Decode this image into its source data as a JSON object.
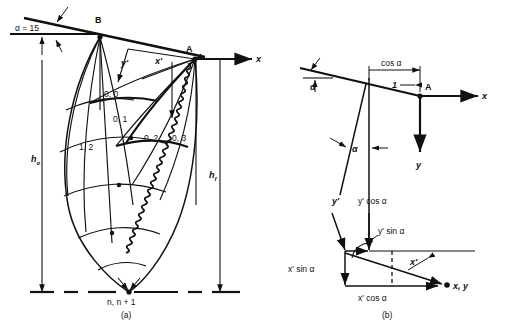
{
  "figure": {
    "caption_a": "(a)",
    "caption_b": "(b)"
  },
  "panel_a": {
    "alpha_label": "α = 15",
    "point_b": "B",
    "point_a": "A",
    "axis_x": "x",
    "axis_y_prime": "y'",
    "axis_x_prime": "x'",
    "height_initial": "h",
    "height_initial_sub": "o",
    "height_final": "h",
    "height_final_sub": "f",
    "node_bottom": "n, n + 1",
    "grid_nodes": [
      {
        "label": "0, 0"
      },
      {
        "label": "0, 1"
      },
      {
        "label": "0, 2"
      },
      {
        "label": "0, 3"
      },
      {
        "label": "1, 2"
      }
    ]
  },
  "panel_b": {
    "alpha_top": "α",
    "alpha_lower": "α",
    "cos_alpha": "cos α",
    "unit_length": "1",
    "point_a": "A",
    "axis_x": "x",
    "axis_y": "y",
    "y_prime": "y'",
    "y_prime_cos_alpha": "y' cos α",
    "y_prime_sin_alpha": "y' sin α",
    "x_prime_sin_alpha": "x' sin α",
    "x_prime": "x'",
    "x_prime_cos_alpha": "x' cos α",
    "resultant": "x, y"
  },
  "colors": {
    "ink": "#111111",
    "paper": "#ffffff"
  }
}
